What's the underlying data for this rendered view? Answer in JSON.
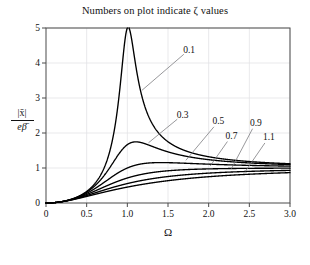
{
  "chart_data": {
    "type": "line",
    "title": "Numbers on plot indicate ζ values",
    "xlabel": "Ω",
    "ylabel_numerator": "|x̄|",
    "ylabel_denominator": "eβ̄",
    "ylabel_text": "|x̄| / eβ̄",
    "grid": true,
    "legend_position": "inline-annotations",
    "annotation_note": "Numbers on plot indicate ζ values",
    "xlim": [
      0,
      3.0
    ],
    "ylim": [
      0,
      5
    ],
    "xticks": [
      0,
      0.5,
      1.0,
      1.5,
      2.0,
      2.5,
      3.0
    ],
    "xtick_labels": [
      "0",
      "0.5",
      "1.0",
      "1.5",
      "2.0",
      "2.5",
      "3.0"
    ],
    "yticks": [
      0,
      1,
      2,
      3,
      4,
      5
    ],
    "ytick_labels": [
      "0",
      "1",
      "2",
      "3",
      "4",
      "5"
    ],
    "formula": "r^2 / sqrt((1-r^2)^2 + (2*zeta*r)^2)",
    "series": [
      {
        "name": "0.1",
        "zeta": 0.1,
        "label": "0.1",
        "label_x": 1.76,
        "label_y": 4.38,
        "leader_to_x": 1.18,
        "leader_to_y": 3.22,
        "peak_x": 1.005,
        "peak_y": 5.03,
        "clipped_at_top": true,
        "values_at": {
          "0.5": 0.333,
          "1.0": 5.03,
          "1.5": 1.77,
          "2.0": 1.32,
          "2.5": 1.19,
          "3.0": 1.13
        }
      },
      {
        "name": "0.3",
        "zeta": 0.3,
        "label": "0.3",
        "label_x": 1.68,
        "label_y": 2.52,
        "leader_to_x": 1.26,
        "leader_to_y": 1.72,
        "peak_x": 1.095,
        "peak_y": 1.79,
        "clipped_at_top": false,
        "values_at": {
          "0.5": 0.327,
          "1.0": 1.667,
          "1.5": 1.44,
          "2.0": 1.25,
          "2.5": 1.16,
          "3.0": 1.12
        }
      },
      {
        "name": "0.5",
        "zeta": 0.5,
        "label": "0.5",
        "label_x": 2.12,
        "label_y": 2.33,
        "leader_to_x": 1.72,
        "leader_to_y": 1.22,
        "peak_x": 1.414,
        "peak_y": 1.155,
        "clipped_at_top": false,
        "values_at": {
          "0.5": 0.316,
          "1.0": 1.0,
          "1.5": 1.13,
          "2.0": 1.11,
          "2.5": 1.09,
          "3.0": 1.07
        }
      },
      {
        "name": "0.7",
        "zeta": 0.7,
        "label": "0.7",
        "label_x": 2.28,
        "label_y": 1.92,
        "leader_to_x": 2.02,
        "leader_to_y": 1.06,
        "peak_x": 2.0,
        "peak_y": 1.03,
        "clipped_at_top": false,
        "values_at": {
          "0.5": 0.302,
          "1.0": 0.714,
          "1.5": 0.93,
          "2.0": 1.02,
          "2.5": 1.03,
          "3.0": 1.03
        }
      },
      {
        "name": "0.9",
        "zeta": 0.9,
        "label": "0.9",
        "label_x": 2.58,
        "label_y": 2.3,
        "leader_to_x": 2.28,
        "leader_to_y": 0.98,
        "peak_x": 3.0,
        "peak_y": 0.99,
        "clipped_at_top": false,
        "values_at": {
          "0.5": 0.284,
          "1.0": 0.556,
          "1.5": 0.8,
          "2.0": 0.92,
          "2.5": 0.96,
          "3.0": 0.98
        }
      },
      {
        "name": "1.1",
        "zeta": 1.1,
        "label": "1.1",
        "label_x": 2.74,
        "label_y": 1.88,
        "leader_to_x": 2.45,
        "leader_to_y": 0.9,
        "peak_x": 3.0,
        "peak_y": 0.95,
        "clipped_at_top": false,
        "values_at": {
          "0.5": 0.264,
          "1.0": 0.455,
          "1.5": 0.7,
          "2.0": 0.84,
          "2.5": 0.91,
          "3.0": 0.94
        }
      }
    ]
  },
  "colors": {
    "curve": "#000000",
    "frame": "#4a4a4a",
    "grid": "#e3e3e6",
    "leader": "#7d7d82",
    "text": "#111111",
    "background": "#ffffff"
  }
}
